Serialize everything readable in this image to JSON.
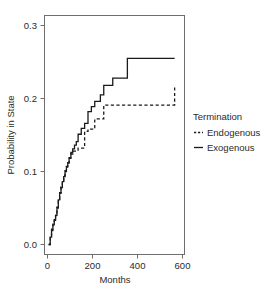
{
  "chart_data": {
    "type": "line",
    "title": "",
    "xlabel": "Months",
    "ylabel": "Probability in State",
    "xlim": [
      0,
      600
    ],
    "ylim": [
      0.0,
      0.3
    ],
    "grid": false,
    "legend_position": "right",
    "legend_title": "Termination",
    "x_ticks": [
      0,
      200,
      400,
      600
    ],
    "x_tick_labels": [
      "0",
      "200",
      "400",
      "600"
    ],
    "y_ticks": [
      0.0,
      0.1,
      0.2,
      0.3
    ],
    "y_tick_labels": [
      "0.0",
      "0.1",
      "0.2",
      "0.3"
    ],
    "step_style": "post",
    "series": [
      {
        "name": "Endogenous",
        "style": "dashed",
        "color": "#1a1a1a",
        "x": [
          5,
          12,
          18,
          24,
          30,
          36,
          42,
          48,
          54,
          60,
          66,
          72,
          78,
          84,
          90,
          96,
          104,
          112,
          120,
          128,
          136,
          150,
          165,
          180,
          195,
          210,
          235,
          250,
          420,
          565
        ],
        "y": [
          0.0,
          0.012,
          0.021,
          0.028,
          0.034,
          0.041,
          0.051,
          0.062,
          0.071,
          0.079,
          0.087,
          0.094,
          0.101,
          0.107,
          0.112,
          0.118,
          0.124,
          0.128,
          0.128,
          0.128,
          0.132,
          0.132,
          0.155,
          0.158,
          0.158,
          0.172,
          0.172,
          0.191,
          0.191,
          0.215
        ]
      },
      {
        "name": "Exogenous",
        "style": "solid",
        "color": "#1a1a1a",
        "x": [
          5,
          12,
          18,
          24,
          30,
          36,
          42,
          48,
          54,
          60,
          66,
          72,
          78,
          84,
          90,
          96,
          104,
          112,
          120,
          128,
          136,
          150,
          165,
          180,
          195,
          210,
          235,
          250,
          290,
          355,
          420,
          565
        ],
        "y": [
          0.0,
          0.01,
          0.019,
          0.027,
          0.033,
          0.04,
          0.05,
          0.061,
          0.07,
          0.078,
          0.086,
          0.093,
          0.1,
          0.106,
          0.112,
          0.119,
          0.126,
          0.131,
          0.136,
          0.141,
          0.151,
          0.159,
          0.166,
          0.182,
          0.189,
          0.196,
          0.205,
          0.218,
          0.228,
          0.255,
          0.255,
          0.255
        ]
      }
    ]
  },
  "legend": {
    "title": "Termination",
    "entries": [
      {
        "label": "Endogenous",
        "style": "dashed"
      },
      {
        "label": "Exogenous",
        "style": "solid"
      }
    ]
  },
  "axes": {
    "x_title": "Months",
    "y_title": "Probability in State",
    "x_tick_labels": [
      "0",
      "200",
      "400",
      "600"
    ],
    "y_tick_labels": [
      "0.0",
      "0.1",
      "0.2",
      "0.3"
    ]
  },
  "colors": {
    "series": "#1a1a1a",
    "frame": "#6e6e6e",
    "background": "#ffffff"
  }
}
